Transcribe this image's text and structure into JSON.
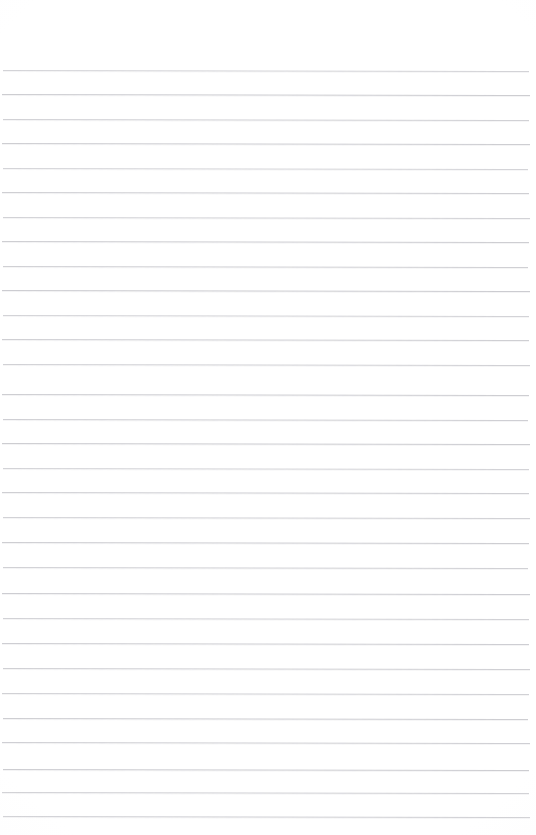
{
  "page": {
    "kind": "scanned-blank-ruled-paper",
    "width_px": 536,
    "height_px": 835,
    "background_color": "#ffffff",
    "written_content": "",
    "header_text": "",
    "footer_text": "",
    "page_number_text": ""
  },
  "ruling": {
    "line_color": "#c9c9ce",
    "line_thickness_px": 1,
    "line_spacing_px": 24.5,
    "first_line_y_px": 70,
    "last_line_y_px": 816,
    "line_start_x_px": 2,
    "line_end_x_px": 529,
    "line_count": 31,
    "slant_deg": 0.11,
    "margin_rule_present": "no",
    "top_margin_px": 70,
    "bottom_margin_px": 19
  },
  "lines": [
    {
      "index": 1,
      "y": 70,
      "x1": 3,
      "x2": 529,
      "opacity": 0.8
    },
    {
      "index": 2,
      "y": 94,
      "x1": 2,
      "x2": 530,
      "opacity": 0.92
    },
    {
      "index": 3,
      "y": 119,
      "x1": 3,
      "x2": 529,
      "opacity": 0.85
    },
    {
      "index": 4,
      "y": 143,
      "x1": 2,
      "x2": 530,
      "opacity": 0.9
    },
    {
      "index": 5,
      "y": 168,
      "x1": 3,
      "x2": 528,
      "opacity": 0.78
    },
    {
      "index": 6,
      "y": 192,
      "x1": 2,
      "x2": 529,
      "opacity": 0.88
    },
    {
      "index": 7,
      "y": 217,
      "x1": 3,
      "x2": 530,
      "opacity": 0.82
    },
    {
      "index": 8,
      "y": 241,
      "x1": 2,
      "x2": 529,
      "opacity": 0.9
    },
    {
      "index": 9,
      "y": 266,
      "x1": 3,
      "x2": 528,
      "opacity": 0.86
    },
    {
      "index": 10,
      "y": 290,
      "x1": 2,
      "x2": 530,
      "opacity": 0.93
    },
    {
      "index": 11,
      "y": 315,
      "x1": 3,
      "x2": 529,
      "opacity": 0.8
    },
    {
      "index": 12,
      "y": 339,
      "x1": 2,
      "x2": 529,
      "opacity": 0.88
    },
    {
      "index": 13,
      "y": 364,
      "x1": 3,
      "x2": 530,
      "opacity": 0.84
    },
    {
      "index": 14,
      "y": 394,
      "x1": 2,
      "x2": 529,
      "opacity": 0.9
    },
    {
      "index": 15,
      "y": 419,
      "x1": 3,
      "x2": 528,
      "opacity": 0.87
    },
    {
      "index": 16,
      "y": 443,
      "x1": 2,
      "x2": 530,
      "opacity": 0.92
    },
    {
      "index": 17,
      "y": 468,
      "x1": 3,
      "x2": 529,
      "opacity": 0.8
    },
    {
      "index": 18,
      "y": 492,
      "x1": 2,
      "x2": 529,
      "opacity": 0.88
    },
    {
      "index": 19,
      "y": 517,
      "x1": 3,
      "x2": 530,
      "opacity": 0.83
    },
    {
      "index": 20,
      "y": 542,
      "x1": 2,
      "x2": 529,
      "opacity": 0.9
    },
    {
      "index": 21,
      "y": 567,
      "x1": 3,
      "x2": 528,
      "opacity": 0.85
    },
    {
      "index": 22,
      "y": 593,
      "x1": 2,
      "x2": 530,
      "opacity": 0.91
    },
    {
      "index": 23,
      "y": 618,
      "x1": 3,
      "x2": 529,
      "opacity": 0.82
    },
    {
      "index": 24,
      "y": 643,
      "x1": 2,
      "x2": 529,
      "opacity": 0.89
    },
    {
      "index": 25,
      "y": 668,
      "x1": 3,
      "x2": 530,
      "opacity": 0.86
    },
    {
      "index": 26,
      "y": 693,
      "x1": 2,
      "x2": 529,
      "opacity": 0.84
    },
    {
      "index": 27,
      "y": 718,
      "x1": 3,
      "x2": 528,
      "opacity": 0.9
    },
    {
      "index": 28,
      "y": 742,
      "x1": 2,
      "x2": 530,
      "opacity": 0.87
    },
    {
      "index": 29,
      "y": 769,
      "x1": 3,
      "x2": 529,
      "opacity": 0.92
    },
    {
      "index": 30,
      "y": 792,
      "x1": 2,
      "x2": 529,
      "opacity": 0.85
    },
    {
      "index": 31,
      "y": 816,
      "x1": 3,
      "x2": 530,
      "opacity": 0.88
    }
  ]
}
